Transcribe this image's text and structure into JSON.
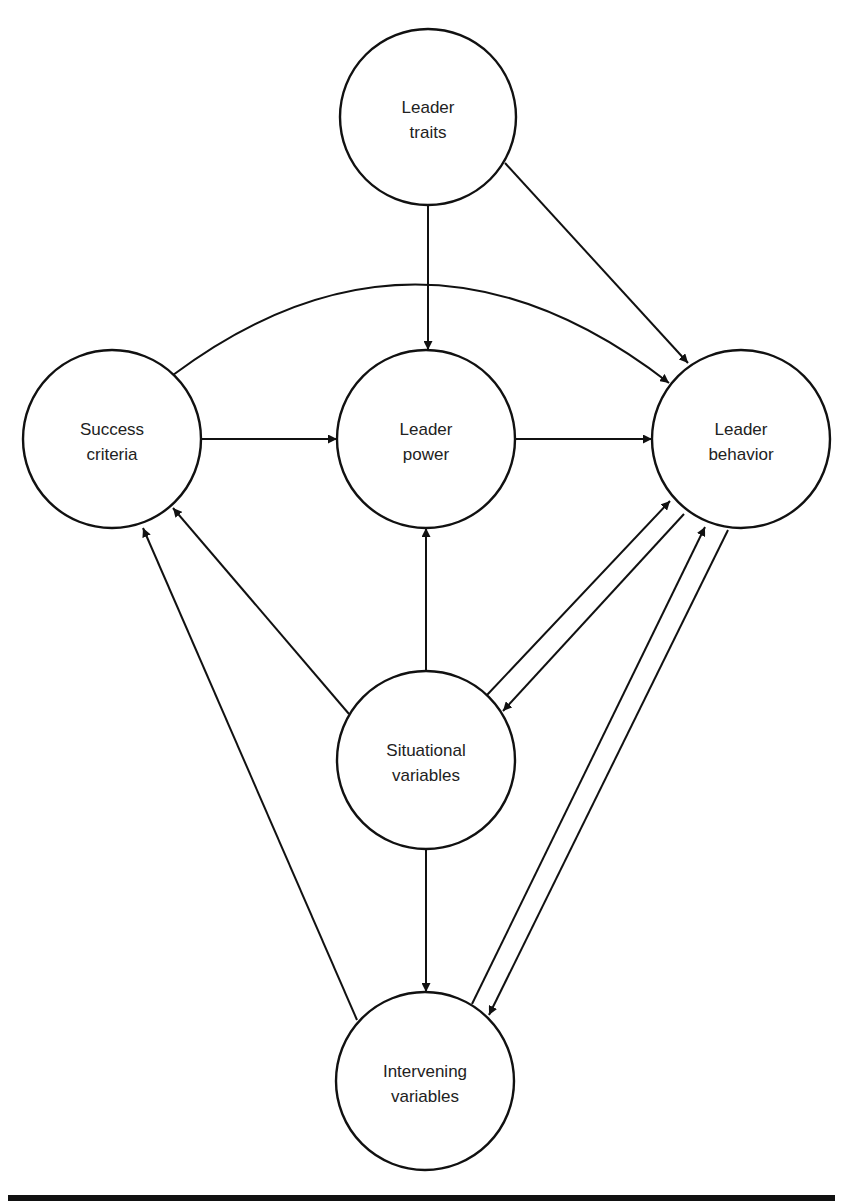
{
  "diagram": {
    "nodes": [
      {
        "id": "leader-traits",
        "line1": "Leader",
        "line2": "traits",
        "cx": 428,
        "cy": 117,
        "r": 88
      },
      {
        "id": "success-criteria",
        "line1": "Success",
        "line2": "criteria",
        "cx": 112,
        "cy": 439,
        "r": 89
      },
      {
        "id": "leader-power",
        "line1": "Leader",
        "line2": "power",
        "cx": 426,
        "cy": 439,
        "r": 89
      },
      {
        "id": "leader-behavior",
        "line1": "Leader",
        "line2": "behavior",
        "cx": 741,
        "cy": 439,
        "r": 89
      },
      {
        "id": "situational-variables",
        "line1": "Situational",
        "line2": "variables",
        "cx": 426,
        "cy": 760,
        "r": 89
      },
      {
        "id": "intervening-variables",
        "line1": "Intervening",
        "line2": "variables",
        "cx": 425,
        "cy": 1081,
        "r": 89
      }
    ],
    "edges": [
      {
        "from": "leader-traits",
        "to": "leader-power",
        "d": "M428,205 L428,350"
      },
      {
        "from": "leader-traits",
        "to": "leader-behavior",
        "d": "M505,163 L688,363"
      },
      {
        "from": "success-criteria",
        "to": "leader-behavior",
        "d": "M173,375 Q420,190 669,383"
      },
      {
        "from": "success-criteria",
        "to": "leader-power",
        "d": "M201,439 L337,439"
      },
      {
        "from": "leader-power",
        "to": "leader-behavior",
        "d": "M515,439 L652,439"
      },
      {
        "from": "situational-variables",
        "to": "leader-power",
        "d": "M426,671 L426,528"
      },
      {
        "from": "situational-variables",
        "to": "success-criteria",
        "d": "M349,714 L173,508"
      },
      {
        "from": "situational-variables",
        "to": "leader-behavior",
        "d": "M487,695 L670,501"
      },
      {
        "from": "leader-behavior",
        "to": "situational-variables",
        "d": "M684,514 L503,711"
      },
      {
        "from": "situational-variables",
        "to": "intervening-variables",
        "d": "M426,849 L426,992"
      },
      {
        "from": "intervening-variables",
        "to": "success-criteria",
        "d": "M357,1020 L143,528"
      },
      {
        "from": "intervening-variables",
        "to": "leader-behavior",
        "d": "M472,1004 L705,527"
      },
      {
        "from": "leader-behavior",
        "to": "intervening-variables",
        "d": "M728,530 L489,1015"
      }
    ]
  }
}
